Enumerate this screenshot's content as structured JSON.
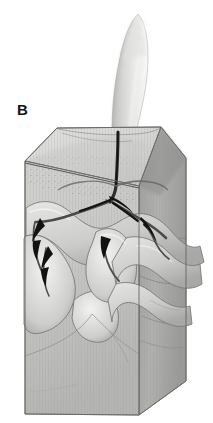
{
  "figure": {
    "panel_label": "B",
    "caption_visible": "",
    "background_color": "#ffffff",
    "style": "grayscale stippled pen-and-ink illustration"
  },
  "colors": {
    "background": "#ffffff",
    "block_top_face": "#d8d8d6",
    "block_front_face": "#c9c9c7",
    "block_right_face": "#a9a9a7",
    "block_outline": "#6f6f6d",
    "stem_light": "#efefee",
    "stem_mid": "#cfcfcd",
    "stem_shadow": "#9a9a98",
    "channel_dark": "#161616",
    "channel_mid": "#5e5e5c",
    "stipple": "#7a7a78",
    "crack_line": "#8a8a88",
    "label_text": "#131313"
  },
  "elements": {
    "panel_label_name": "panel-label-b",
    "stem_name": "plant-stem",
    "block_name": "soil-block",
    "top_face_name": "soil-surface-top-face",
    "front_face_name": "soil-block-front-face",
    "right_face_name": "soil-block-right-face",
    "litter_band_name": "surface-litter-band",
    "root_main_name": "main-root-channel",
    "root_branch_left_name": "left-root-branch",
    "root_branch_right_name": "right-root-branch",
    "arrow_names": [
      "flow-arrow-upper-left",
      "flow-arrow-lower-left",
      "flow-arrow-center",
      "flow-arrow-right",
      "flow-arrow-junction"
    ],
    "lobe_name": "soil-lobe",
    "crack_name": "soil-crack-line"
  },
  "geometry": {
    "image_width": 213,
    "image_height": 423,
    "block_top_left_vertex": "57,128",
    "block_top_right_vertex": "161,127",
    "block_front_left_vertex": "25,161",
    "block_bottom_left_vertex": "25,414",
    "block_bottom_right_vertex": "139,415",
    "block_right_lower_vertex": "186,381",
    "stem_base": "118,130",
    "stem_tip": "140,13"
  }
}
